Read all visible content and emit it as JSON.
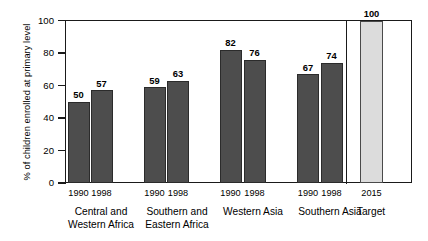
{
  "chart_data": {
    "type": "bar",
    "title": "",
    "xlabel": "",
    "ylabel": "% of children enrolled at primary level",
    "ylim": [
      0,
      100
    ],
    "yticks": [
      0,
      20,
      40,
      60,
      80,
      100
    ],
    "grid": false,
    "legend": "none",
    "groups": [
      {
        "label_line1": "Central and",
        "label_line2": "Western Africa",
        "bars": [
          {
            "category": "1990",
            "value": 50,
            "value_label": "50",
            "style": "dark"
          },
          {
            "category": "1998",
            "value": 57,
            "value_label": "57",
            "style": "dark"
          }
        ]
      },
      {
        "label_line1": "Southern and",
        "label_line2": "Eastern Africa",
        "bars": [
          {
            "category": "1990",
            "value": 59,
            "value_label": "59",
            "style": "dark"
          },
          {
            "category": "1998",
            "value": 63,
            "value_label": "63",
            "style": "dark"
          }
        ]
      },
      {
        "label_line1": "Western Asia",
        "label_line2": "",
        "bars": [
          {
            "category": "1990",
            "value": 82,
            "value_label": "82",
            "style": "dark"
          },
          {
            "category": "1998",
            "value": 76,
            "value_label": "76",
            "style": "dark"
          }
        ]
      },
      {
        "label_line1": "Southern Asia",
        "label_line2": "",
        "bars": [
          {
            "category": "1990",
            "value": 67,
            "value_label": "67",
            "style": "dark"
          },
          {
            "category": "1998",
            "value": 74,
            "value_label": "74",
            "style": "dark"
          }
        ]
      },
      {
        "label_line1": "Target",
        "label_line2": "",
        "bars": [
          {
            "category": "2015",
            "value": 100,
            "value_label": "100",
            "style": "light"
          }
        ]
      }
    ],
    "categories": [
      "1990",
      "1998",
      "1990",
      "1998",
      "1990",
      "1998",
      "1990",
      "1998",
      "2015"
    ],
    "values": [
      50,
      57,
      59,
      63,
      82,
      76,
      67,
      74,
      100
    ],
    "colors": {
      "bar_dark": "#4d4d4d",
      "bar_light": "#dcdcdc",
      "axis": "#1a1a1a",
      "text": "#000000",
      "background": "#ffffff"
    }
  }
}
